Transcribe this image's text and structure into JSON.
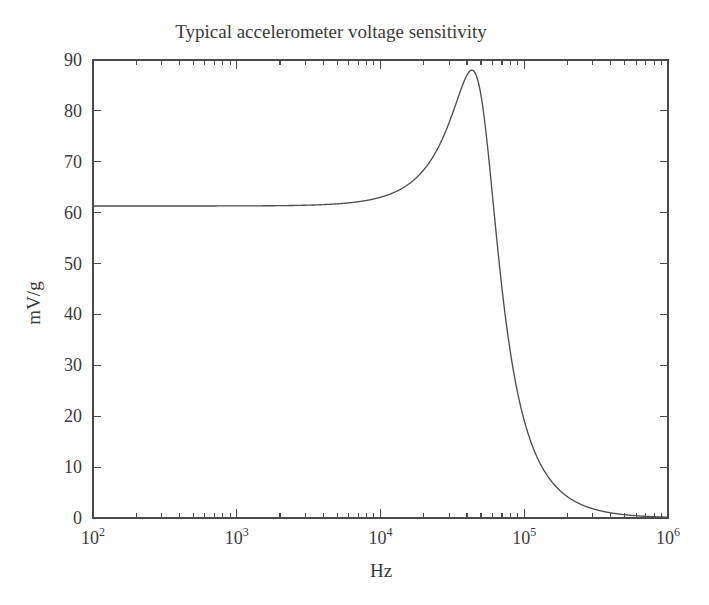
{
  "chart_data": {
    "type": "line",
    "title": "Typical accelerometer voltage sensitivity",
    "xlabel": "Hz",
    "ylabel": "mV/g",
    "xscale": "log",
    "yscale": "linear",
    "xlim": [
      100,
      1000000
    ],
    "ylim": [
      0,
      90
    ],
    "grid": false,
    "legend": null,
    "xticks": [
      {
        "value": 100,
        "label": "10",
        "exponent": "2"
      },
      {
        "value": 1000,
        "label": "10",
        "exponent": "3"
      },
      {
        "value": 10000,
        "label": "10",
        "exponent": "4"
      },
      {
        "value": 100000,
        "label": "10",
        "exponent": "5"
      },
      {
        "value": 1000000,
        "label": "10",
        "exponent": "6"
      }
    ],
    "yticks": [
      0,
      10,
      20,
      30,
      40,
      50,
      60,
      70,
      80,
      90
    ],
    "minor_ticks_per_decade": [
      2,
      3,
      4,
      5,
      6,
      7,
      8,
      9
    ],
    "curve_color": "#4f4f4f",
    "model": {
      "description": "Second-order resonant response of a piezoelectric accelerometer",
      "low_frequency_sensitivity": 67.3,
      "resonant_frequency": 51000,
      "quality_factor": 1.33,
      "peak_value": 88.0,
      "peak_frequency": 51000,
      "value_at_1e6": 0.9
    },
    "series": [
      {
        "name": "voltage sensitivity",
        "x": [
          100,
          200,
          400,
          700,
          1000,
          2000,
          4000,
          7000,
          10000,
          14000,
          18000,
          22000,
          26000,
          30000,
          34000,
          38000,
          42000,
          45000,
          48000,
          51000,
          54000,
          58000,
          62000,
          68000,
          75000,
          85000,
          100000,
          120000,
          150000,
          200000,
          300000,
          400000,
          600000,
          800000,
          1000000
        ],
        "y": [
          67.3,
          67.3,
          67.3,
          67.3,
          67.3,
          67.4,
          67.7,
          68.6,
          70.0,
          72.3,
          75.6,
          79.4,
          83.2,
          86.1,
          87.8,
          88.0,
          86.3,
          83.5,
          79.7,
          75.3,
          70.6,
          64.4,
          58.5,
          50.4,
          42.7,
          34.2,
          24.8,
          17.5,
          11.3,
          6.4,
          2.9,
          1.6,
          0.73,
          0.42,
          0.27
        ]
      }
    ]
  },
  "figure": {
    "background_color": "#ffffff",
    "frame_color": "#4a4a4a",
    "text_color": "#3a3a3a"
  }
}
